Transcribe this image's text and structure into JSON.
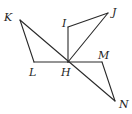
{
  "diagram": {
    "type": "geometry",
    "points": {
      "K": {
        "x": 20,
        "y": 20,
        "label": "K",
        "lx": 4,
        "ly": 21
      },
      "L": {
        "x": 34,
        "y": 62,
        "label": "L",
        "lx": 29,
        "ly": 76
      },
      "H": {
        "x": 68,
        "y": 62,
        "label": "H",
        "lx": 61,
        "ly": 76
      },
      "I": {
        "x": 68,
        "y": 27,
        "label": "I",
        "lx": 62,
        "ly": 27
      },
      "J": {
        "x": 108,
        "y": 13,
        "label": "J",
        "lx": 112,
        "ly": 16
      },
      "M": {
        "x": 102,
        "y": 62,
        "label": "M",
        "lx": 98,
        "ly": 59
      },
      "N": {
        "x": 115,
        "y": 101,
        "label": "N",
        "lx": 119,
        "ly": 108
      }
    },
    "segments": [
      [
        "K",
        "L"
      ],
      [
        "L",
        "H"
      ],
      [
        "K",
        "N"
      ],
      [
        "I",
        "H"
      ],
      [
        "I",
        "J"
      ],
      [
        "J",
        "H"
      ],
      [
        "H",
        "M"
      ],
      [
        "M",
        "N"
      ]
    ],
    "triangles": [
      "KLH",
      "HIJ",
      "HMN"
    ],
    "stroke_color": "#2a2a2a"
  }
}
